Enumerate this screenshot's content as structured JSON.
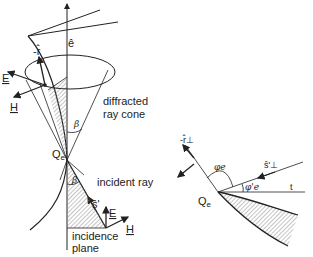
{
  "figure": {
    "left_panel": {
      "labels": {
        "edge_vector": "ê",
        "neg_r_hat": "-r̂",
        "E_top": "E",
        "H_top": "H",
        "beta_top": "β",
        "diffracted_line1": "diffracted",
        "diffracted_line2": "ray  cone",
        "Q_point": "Q",
        "Q_sub": "e",
        "beta_bottom": "β",
        "incident_ray": "incident  ray",
        "s_hat": "ŝ'",
        "E_bottom": "E",
        "H_bottom": "H",
        "incidence_line1": "incidence",
        "incidence_line2": "plane"
      }
    },
    "right_panel": {
      "labels": {
        "neg_r_perp": "-r̂⊥",
        "phi_e": "φe",
        "phi_e_prime": "φ'e",
        "s_perp": "ŝ'⊥",
        "t_axis": "t",
        "Q_point": "Q",
        "Q_sub": "e"
      }
    },
    "colors": {
      "ink": "#222222",
      "hatch": "#9a9a9a",
      "background": "#ffffff"
    }
  }
}
